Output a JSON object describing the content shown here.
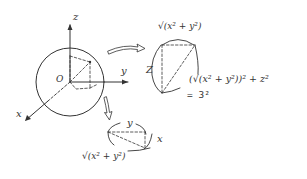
{
  "diagram": {
    "title": "",
    "colors": {
      "ink": "#333333",
      "background": "#ffffff"
    },
    "sphere": {
      "center": [
        70,
        82
      ],
      "radius": 34,
      "origin_label": "O",
      "point": [
        90,
        62
      ]
    },
    "axes": {
      "z": {
        "label": "z",
        "end": [
          70,
          24
        ]
      },
      "y": {
        "label": "y",
        "end": [
          128,
          82
        ]
      },
      "x": {
        "label": "x",
        "end": [
          26,
          120
        ]
      }
    },
    "side_view": {
      "label_top": "√(x² + y²)",
      "label_left": "Z",
      "formula_line1": "(√(x² + y²))² + z²",
      "formula_line2": "= 3²"
    },
    "bottom_view": {
      "label_top": "y",
      "label_right": "x",
      "label_bottom": "√(x² + y²)"
    },
    "arrows": [
      {
        "name": "arrow-to-side-view",
        "direction": "right"
      },
      {
        "name": "arrow-to-bottom-view",
        "direction": "down"
      }
    ]
  }
}
